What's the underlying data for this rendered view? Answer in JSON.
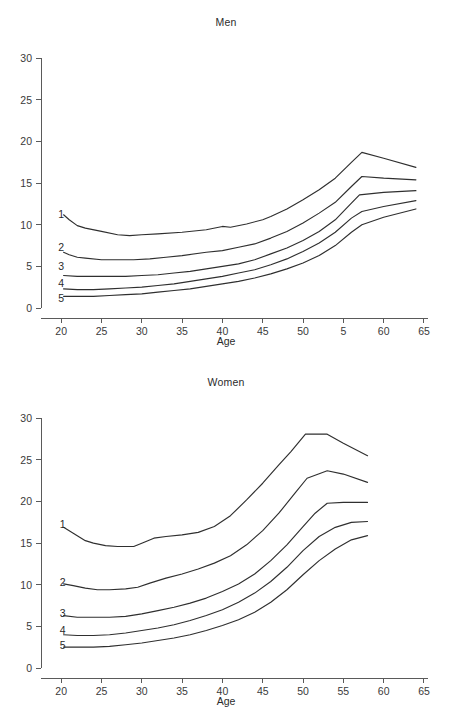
{
  "figure": {
    "panels": [
      "Men",
      "Women"
    ],
    "xlabel": "Age",
    "title_men": "Men",
    "title_women": "Women"
  },
  "chart_data": [
    {
      "type": "line",
      "title": "Men",
      "xlabel": "Age",
      "ylabel": "",
      "xlim": [
        17.5,
        65.5
      ],
      "ylim": [
        0,
        31
      ],
      "grid": false,
      "legend": "inline-left-labels",
      "xticks": [
        20,
        25,
        30,
        35,
        40,
        45,
        50,
        55,
        60,
        65
      ],
      "xticklabels": [
        "20",
        "25",
        "30",
        "35",
        "40",
        "45",
        "50",
        "5",
        "60",
        "65"
      ],
      "yticks": [
        0,
        5,
        10,
        15,
        20,
        25,
        30
      ],
      "yticklabels": [
        "0",
        "5",
        "10",
        "15",
        "20",
        "25",
        "30"
      ],
      "series": [
        {
          "name": "1",
          "label": "1",
          "label_x": 20.0,
          "label_y": 11.3,
          "x": [
            20.3,
            21.0,
            22.0,
            23.0,
            25.0,
            27.0,
            28.5,
            30.0,
            32.0,
            35.0,
            38.0,
            40.0,
            41.0,
            43.0,
            45.0,
            46.0,
            48.0,
            50.0,
            52.0,
            54.0,
            56.0,
            57.3,
            60.0,
            64.0
          ],
          "y": [
            11.2,
            10.6,
            9.9,
            9.6,
            9.2,
            8.8,
            8.7,
            8.8,
            8.9,
            9.1,
            9.4,
            9.8,
            9.7,
            10.1,
            10.6,
            11.0,
            11.9,
            13.0,
            14.2,
            15.6,
            17.5,
            18.7,
            18.0,
            16.9
          ]
        },
        {
          "name": "2",
          "label": "2",
          "label_x": 20.0,
          "label_y": 7.3,
          "x": [
            20.3,
            21.0,
            22.0,
            23.0,
            25.0,
            27.0,
            29.0,
            31.0,
            33.0,
            35.0,
            38.0,
            40.0,
            42.0,
            44.0,
            46.0,
            48.0,
            50.0,
            52.0,
            54.0,
            56.0,
            57.3,
            60.0,
            64.0
          ],
          "y": [
            6.7,
            6.4,
            6.1,
            6.0,
            5.8,
            5.8,
            5.8,
            5.9,
            6.1,
            6.3,
            6.7,
            6.9,
            7.3,
            7.7,
            8.4,
            9.2,
            10.2,
            11.4,
            12.7,
            14.6,
            15.8,
            15.6,
            15.4
          ]
        },
        {
          "name": "3",
          "label": "3",
          "label_x": 20.0,
          "label_y": 5.0,
          "x": [
            20.3,
            22.0,
            24.0,
            26.0,
            28.0,
            30.0,
            32.0,
            34.0,
            36.0,
            38.0,
            40.0,
            42.0,
            44.0,
            46.0,
            48.0,
            50.0,
            52.0,
            54.0,
            56.0,
            57.0,
            60.0,
            64.0
          ],
          "y": [
            3.9,
            3.8,
            3.8,
            3.8,
            3.8,
            3.9,
            4.0,
            4.2,
            4.4,
            4.7,
            5.0,
            5.3,
            5.8,
            6.5,
            7.2,
            8.1,
            9.2,
            10.6,
            12.6,
            13.6,
            13.9,
            14.1
          ]
        },
        {
          "name": "4",
          "label": "4",
          "label_x": 20.0,
          "label_y": 3.0,
          "x": [
            20.3,
            22.0,
            24.0,
            26.0,
            28.0,
            30.0,
            32.0,
            34.0,
            36.0,
            38.0,
            40.0,
            42.0,
            44.0,
            46.0,
            48.0,
            50.0,
            52.0,
            54.0,
            56.0,
            57.3,
            60.0,
            64.0
          ],
          "y": [
            2.3,
            2.2,
            2.2,
            2.3,
            2.4,
            2.5,
            2.7,
            2.9,
            3.2,
            3.5,
            3.8,
            4.2,
            4.6,
            5.2,
            5.9,
            6.8,
            7.8,
            9.1,
            10.8,
            11.6,
            12.2,
            12.9
          ]
        },
        {
          "name": "5",
          "label": "5",
          "label_x": 20.0,
          "label_y": 1.2,
          "x": [
            20.3,
            22.0,
            24.0,
            26.0,
            28.0,
            30.0,
            32.0,
            34.0,
            36.0,
            38.0,
            40.0,
            42.0,
            44.0,
            46.0,
            48.0,
            50.0,
            52.0,
            54.0,
            56.0,
            57.3,
            60.0,
            64.0
          ],
          "y": [
            1.4,
            1.4,
            1.4,
            1.5,
            1.6,
            1.7,
            1.9,
            2.1,
            2.3,
            2.6,
            2.9,
            3.2,
            3.6,
            4.1,
            4.7,
            5.4,
            6.3,
            7.5,
            9.1,
            10.0,
            10.9,
            11.9
          ]
        }
      ]
    },
    {
      "type": "line",
      "title": "Women",
      "xlabel": "Age",
      "ylabel": "",
      "xlim": [
        17.5,
        65.5
      ],
      "ylim": [
        0,
        31
      ],
      "grid": false,
      "legend": "inline-left-labels",
      "xticks": [
        20,
        25,
        30,
        35,
        40,
        45,
        50,
        55,
        60,
        65
      ],
      "xticklabels": [
        "20",
        "25",
        "30",
        "35",
        "40",
        "45",
        "50",
        "55",
        "60",
        "65"
      ],
      "yticks": [
        0,
        5,
        10,
        15,
        20,
        25,
        30
      ],
      "yticklabels": [
        "0",
        "5",
        "10",
        "15",
        "20",
        "25",
        "30"
      ],
      "series": [
        {
          "name": "1",
          "label": "1",
          "label_x": 20.2,
          "label_y": 17.3,
          "x": [
            20.3,
            21.5,
            23.0,
            24.0,
            25.5,
            27.0,
            29.0,
            30.0,
            31.5,
            33.0,
            35.0,
            37.0,
            39.0,
            41.0,
            43.0,
            45.0,
            47.0,
            48.5,
            50.3,
            53.0,
            55.0,
            58.0
          ],
          "y": [
            16.9,
            16.2,
            15.3,
            15.0,
            14.7,
            14.6,
            14.6,
            15.0,
            15.6,
            15.8,
            16.0,
            16.3,
            17.0,
            18.3,
            20.2,
            22.2,
            24.4,
            26.0,
            28.1,
            28.1,
            27.0,
            25.5
          ]
        },
        {
          "name": "2",
          "label": "2",
          "label_x": 20.2,
          "label_y": 10.3,
          "x": [
            20.3,
            21.5,
            23.0,
            24.5,
            26.0,
            28.0,
            29.5,
            31.0,
            33.0,
            35.0,
            37.0,
            39.0,
            41.0,
            43.0,
            45.0,
            47.0,
            49.0,
            50.5,
            53.0,
            55.0,
            58.0
          ],
          "y": [
            10.1,
            9.9,
            9.6,
            9.4,
            9.4,
            9.5,
            9.7,
            10.2,
            10.8,
            11.3,
            11.9,
            12.6,
            13.5,
            14.8,
            16.5,
            18.6,
            21.0,
            22.8,
            23.7,
            23.3,
            22.3
          ]
        },
        {
          "name": "3",
          "label": "3",
          "label_x": 20.2,
          "label_y": 6.6,
          "x": [
            20.3,
            22.0,
            24.0,
            26.0,
            28.0,
            30.0,
            32.0,
            34.0,
            36.0,
            38.0,
            40.0,
            42.0,
            44.0,
            46.0,
            48.0,
            50.0,
            51.5,
            53.0,
            55.0,
            58.0
          ],
          "y": [
            6.3,
            6.1,
            6.1,
            6.1,
            6.2,
            6.5,
            6.9,
            7.3,
            7.8,
            8.4,
            9.2,
            10.1,
            11.3,
            12.9,
            14.8,
            17.0,
            18.6,
            19.8,
            19.9,
            19.9
          ]
        },
        {
          "name": "4",
          "label": "4",
          "label_x": 20.2,
          "label_y": 4.5,
          "x": [
            20.3,
            22.0,
            24.0,
            26.0,
            28.0,
            30.0,
            32.0,
            34.0,
            36.0,
            38.0,
            40.0,
            42.0,
            44.0,
            46.0,
            48.0,
            50.0,
            52.0,
            54.0,
            56.0,
            58.0
          ],
          "y": [
            4.0,
            3.9,
            3.9,
            4.0,
            4.2,
            4.5,
            4.8,
            5.2,
            5.7,
            6.3,
            7.0,
            7.9,
            9.0,
            10.4,
            12.1,
            14.1,
            15.8,
            16.9,
            17.5,
            17.6
          ]
        },
        {
          "name": "5",
          "label": "5",
          "label_x": 20.2,
          "label_y": 2.7,
          "x": [
            20.3,
            22.0,
            24.0,
            26.0,
            28.0,
            30.0,
            32.0,
            34.0,
            36.0,
            38.0,
            40.0,
            42.0,
            44.0,
            46.0,
            48.0,
            50.0,
            52.0,
            54.0,
            56.0,
            58.0
          ],
          "y": [
            2.5,
            2.5,
            2.5,
            2.6,
            2.8,
            3.0,
            3.3,
            3.6,
            4.0,
            4.5,
            5.1,
            5.8,
            6.7,
            7.9,
            9.4,
            11.2,
            12.9,
            14.3,
            15.4,
            15.9
          ]
        }
      ]
    }
  ]
}
